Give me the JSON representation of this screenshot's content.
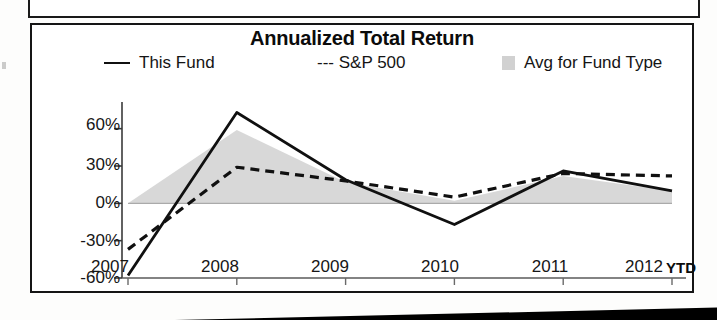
{
  "chart_data": {
    "type": "line",
    "title": "Annualized Total Return",
    "xlabel": "",
    "ylabel": "",
    "categories": [
      "2007",
      "2008",
      "2009",
      "2010",
      "2011",
      "2012"
    ],
    "x_axis_note": "YTD",
    "ylim": [
      -60,
      75
    ],
    "ytick_labels": [
      "60%",
      "30%",
      "0%",
      "-30%",
      "-60%"
    ],
    "ytick_values": [
      60,
      30,
      0,
      -30,
      -60
    ],
    "grid": false,
    "legend_position": "top",
    "series": [
      {
        "name": "This Fund",
        "style": "solid-line",
        "color": "#101010",
        "values": [
          -58,
          73,
          19,
          -17,
          26,
          10
        ]
      },
      {
        "name": "S&P 500",
        "style": "dashed-line",
        "color": "#101010",
        "values": [
          -37,
          29,
          18,
          5,
          24,
          22
        ]
      },
      {
        "name": "Avg for Fund Type",
        "style": "filled-area",
        "color": "#c9c9c9",
        "values": [
          0,
          59,
          17,
          2,
          22,
          10
        ]
      }
    ]
  },
  "chart": {
    "title": "Annualized Total Return",
    "legend": {
      "this_fund_label": "This Fund",
      "sp500_label": "--- S&P 500",
      "avg_fund_type_label": "Avg for Fund Type"
    },
    "y_axis": {
      "tick_0": "60%",
      "tick_1": "30%",
      "tick_2": "0%",
      "tick_3": "-30%",
      "tick_4": "-60%"
    },
    "x_axis": {
      "tick_0": "2007",
      "tick_1": "2008",
      "tick_2": "2009",
      "tick_3": "2010",
      "tick_4": "2011",
      "tick_5": "2012",
      "ytd_note": "YTD"
    }
  }
}
